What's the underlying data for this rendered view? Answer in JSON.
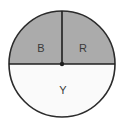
{
  "figure": {
    "type": "circle-sector-diagram",
    "background_color": "#ffffff",
    "title": "",
    "circle": {
      "center_x": 62,
      "center_y": 64,
      "radius": 53,
      "outline_color": "#2b2b2b",
      "outline_width": 1.6
    },
    "center_dot": {
      "name": "center-point",
      "color": "#1f1f1f",
      "radius": 2.2
    },
    "divider_lines": [
      {
        "name": "vertical-radius-line",
        "from": "center",
        "to": "top",
        "color": "#1f1f1f",
        "width": 1.6
      },
      {
        "name": "horizontal-diameter-line",
        "from": "left",
        "to": "right",
        "color": "#1f1f1f",
        "width": 1.6
      }
    ],
    "sectors": [
      {
        "id": "sector-b",
        "label": "B",
        "fill": "#ababab",
        "start_angle": 180,
        "end_angle": 270,
        "fraction": 0.25,
        "label_x": 41,
        "label_y": 49
      },
      {
        "id": "sector-r",
        "label": "R",
        "fill": "#ababab",
        "start_angle": 270,
        "end_angle": 360,
        "fraction": 0.25,
        "label_x": 83,
        "label_y": 49
      },
      {
        "id": "sector-y",
        "label": "Y",
        "fill": "#fafafa",
        "start_angle": 0,
        "end_angle": 180,
        "fraction": 0.5,
        "label_x": 63,
        "label_y": 91
      }
    ]
  }
}
